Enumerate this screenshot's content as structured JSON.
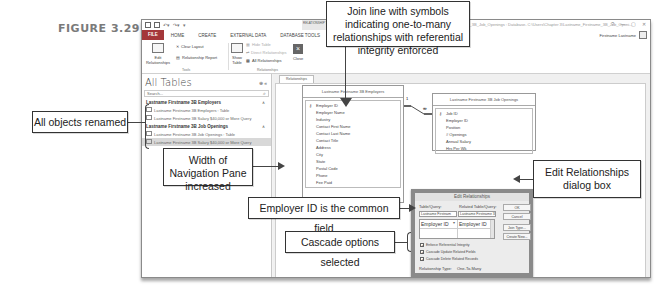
{
  "figure_label": "FIGURE 3.29",
  "window": {
    "contextual_tab": "RELATIONSHIP TOOLS",
    "doc_title": "Lastname_Firstname_3B_Job_Openings : Database- C:\\Users\\Chapter 3\\Lastname_Firstname_3B_Job_Openi...",
    "controls": [
      "?",
      "—",
      "▢",
      "✕"
    ],
    "user": "Firstname Lastname",
    "ribbon_tabs": [
      "FILE",
      "HOME",
      "CREATE",
      "EXTERNAL DATA",
      "DATABASE TOOLS",
      "DESIGN"
    ],
    "ribbon": {
      "edit_relationships": "Edit Relationships",
      "clear_layout": "Clear Layout",
      "relationship_report": "Relationship Report",
      "tools_group": "Tools",
      "show_table": "Show Table",
      "hide_table": "Hide Table",
      "direct_relationships": "Direct Relationships",
      "all_relationships": "All Relationships",
      "relationships_group": "Relationships",
      "close": "Close"
    }
  },
  "nav_pane": {
    "title": "All Tables",
    "search_placeholder": "Search...",
    "groups": [
      {
        "name": "Lastname Firstname 3B Employers",
        "items": [
          {
            "label": "Lastname Firstname 3B Employers : Table",
            "type": "table"
          },
          {
            "label": "Lastname Firstname 3B Salary $40,000 or More Query",
            "type": "query"
          }
        ]
      },
      {
        "name": "Lastname Firstname 3B Job Openings",
        "items": [
          {
            "label": "Lastname Firstname 3B Job Openings : Table",
            "type": "table"
          },
          {
            "label": "Lastname Firstname 3B Salary $40,000 or More Query",
            "type": "query",
            "selected": true
          }
        ]
      }
    ]
  },
  "doc_tab": "Relationships",
  "tables": [
    {
      "title": "Lastname Firstname 3B Employers",
      "fields": [
        "Employer ID",
        "Employer Name",
        "Industry",
        "Contact First Name",
        "Contact Last Name",
        "Contact Title",
        "Address",
        "City",
        "State",
        "Postal Code",
        "Phone",
        "Fee Paid"
      ],
      "key_field": "Employer ID"
    },
    {
      "title": "Lastname Firstname 3B Job Openings",
      "fields": [
        "Job ID",
        "Employer ID",
        "Position",
        "# Openings",
        "Annual Salary",
        "Hrs Per Wk"
      ],
      "key_field": "Job ID"
    }
  ],
  "join_symbols": {
    "one": "1",
    "many": "∞"
  },
  "dialog": {
    "title": "Edit Relationships",
    "table_query_label": "Table/Query:",
    "related_label": "Related Table/Query:",
    "table_query_value": "Lastname Firstnam",
    "related_value": "Lastname Firstname 3I",
    "field_left": "Employer ID",
    "field_right": "Employer ID",
    "buttons": [
      "OK",
      "Cancel",
      "Join Type...",
      "Create New..."
    ],
    "checkboxes": [
      {
        "label": "Enforce Referential Integrity",
        "checked": true
      },
      {
        "label": "Cascade Update Related Fields",
        "checked": true
      },
      {
        "label": "Cascade Delete Related Records",
        "checked": true
      }
    ],
    "relationship_type_label": "Relationship Type:",
    "relationship_type_value": "One-To-Many"
  },
  "callouts": {
    "join_line": "Join line with symbols indicating one-to-many relationships with referential integrity enforced",
    "all_objects": "All objects renamed",
    "nav_width": "Width of Navigation Pane increased",
    "edit_dialog": "Edit Relationships dialog box",
    "common_field": "Employer ID is the common field",
    "cascade": "Cascade options selected"
  }
}
